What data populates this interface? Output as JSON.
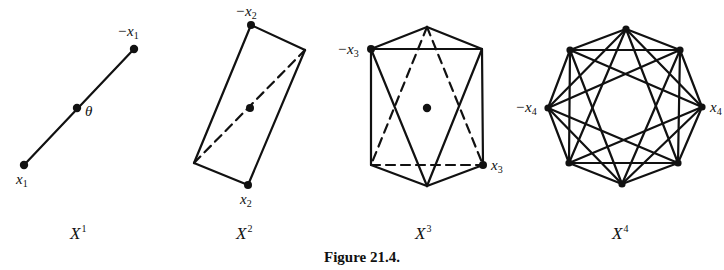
{
  "figure": {
    "title": "Figure 21.4.",
    "panels": [
      {
        "id": "X1",
        "caption_base": "X",
        "caption_sup": "1",
        "vertex_labels": [
          {
            "text": "−x",
            "sub": "1",
            "role": "top-vertex"
          },
          {
            "text": "x",
            "sub": "1",
            "role": "bottom-vertex"
          },
          {
            "text": "θ",
            "sub": "",
            "role": "center"
          }
        ],
        "vertices": [
          [
            24,
            165
          ],
          [
            77,
            108
          ],
          [
            134,
            49
          ]
        ],
        "edges": [
          [
            [
              24,
              165
            ],
            [
              134,
              49
            ]
          ]
        ]
      },
      {
        "id": "X2",
        "caption_base": "X",
        "caption_sup": "2",
        "vertex_labels": [
          {
            "text": "−x",
            "sub": "2",
            "role": "top-vertex"
          },
          {
            "text": "x",
            "sub": "2",
            "role": "bottom-vertex"
          }
        ],
        "vertices": [
          [
            251,
            25
          ],
          [
            305,
            50
          ],
          [
            248,
            185
          ],
          [
            194,
            163
          ]
        ],
        "center": [
          250,
          108
        ],
        "solid_edges": [
          [
            [
              251,
              25
            ],
            [
              305,
              50
            ]
          ],
          [
            [
              305,
              50
            ],
            [
              248,
              185
            ]
          ],
          [
            [
              248,
              185
            ],
            [
              194,
              163
            ]
          ],
          [
            [
              194,
              163
            ],
            [
              251,
              25
            ]
          ]
        ],
        "dashed_edges": [
          [
            [
              194,
              163
            ],
            [
              305,
              50
            ]
          ]
        ]
      },
      {
        "id": "X3",
        "caption_base": "X",
        "caption_sup": "3",
        "vertex_labels": [
          {
            "text": "−x",
            "sub": "3",
            "role": "upper-left-vertex"
          },
          {
            "text": "x",
            "sub": "3",
            "role": "lower-right-vertex"
          }
        ],
        "vertices": [
          [
            427,
            27
          ],
          [
            371,
            49
          ],
          [
            482,
            49
          ],
          [
            371,
            165
          ],
          [
            483,
            165
          ],
          [
            427,
            186
          ]
        ],
        "center": [
          427,
          108
        ],
        "solid_edges": [
          [
            [
              427,
              27
            ],
            [
              371,
              49
            ]
          ],
          [
            [
              427,
              27
            ],
            [
              482,
              49
            ]
          ],
          [
            [
              371,
              49
            ],
            [
              482,
              49
            ]
          ],
          [
            [
              371,
              49
            ],
            [
              371,
              165
            ]
          ],
          [
            [
              482,
              49
            ],
            [
              483,
              165
            ]
          ],
          [
            [
              371,
              165
            ],
            [
              427,
              186
            ]
          ],
          [
            [
              483,
              165
            ],
            [
              427,
              186
            ]
          ],
          [
            [
              371,
              49
            ],
            [
              427,
              186
            ]
          ],
          [
            [
              482,
              49
            ],
            [
              427,
              186
            ]
          ]
        ],
        "dashed_edges": [
          [
            [
              427,
              27
            ],
            [
              371,
              165
            ]
          ],
          [
            [
              427,
              27
            ],
            [
              483,
              165
            ]
          ],
          [
            [
              371,
              165
            ],
            [
              483,
              165
            ]
          ]
        ]
      },
      {
        "id": "X4",
        "caption_base": "X",
        "caption_sup": "4",
        "vertex_labels": [
          {
            "text": "−x",
            "sub": "4",
            "role": "left-vertex"
          },
          {
            "text": "x",
            "sub": "4",
            "role": "right-vertex"
          }
        ],
        "vertices": [
          [
            626,
            29
          ],
          [
            680,
            50
          ],
          [
            702,
            107
          ],
          [
            678,
            163
          ],
          [
            622,
            184
          ],
          [
            569,
            163
          ],
          [
            548,
            108
          ],
          [
            570,
            50
          ]
        ],
        "edge_rule": "connect every pair except antipodal pairs"
      }
    ]
  }
}
